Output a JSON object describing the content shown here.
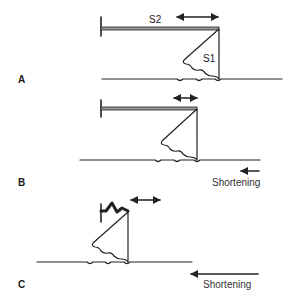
{
  "diagram": {
    "panels": [
      {
        "id": "A",
        "label": "A",
        "s2_label": "S2",
        "s1_label": "S1",
        "shortening_label": null
      },
      {
        "id": "B",
        "label": "B",
        "shortening_label": "Shortening"
      },
      {
        "id": "C",
        "label": "C",
        "shortening_label": "Shortening"
      }
    ],
    "colors": {
      "stroke": "#222222",
      "s2_fill": "#9a9a9a",
      "text": "#1a1a1a"
    }
  }
}
